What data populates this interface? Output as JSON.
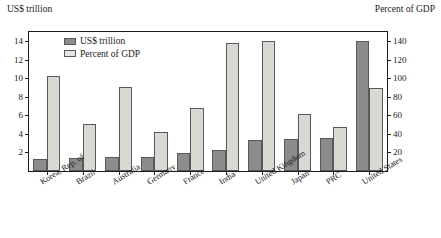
{
  "header": {
    "left_axis_title": "US$ trillion",
    "right_axis_title": "Percent of GDP"
  },
  "legend": {
    "items": [
      {
        "label": "US$ trillion",
        "color": "#8c8c8c",
        "key": "dark"
      },
      {
        "label": "Percent of GDP",
        "color": "#d9d9d4",
        "key": "light"
      }
    ]
  },
  "colors": {
    "dark_bar": "#8c8c8c",
    "light_bar": "#d9d9d4",
    "bar_outline": "#55595c",
    "frame": "#1a1a1a",
    "background": "#ffffff"
  },
  "chart_data": {
    "type": "bar",
    "title": "",
    "xlabel": "",
    "ylabel": "US$ trillion",
    "y2label": "Percent of GDP",
    "ylim": [
      0,
      15
    ],
    "y2lim": [
      0,
      150
    ],
    "yticks": [
      2,
      4,
      6,
      8,
      10,
      12,
      14
    ],
    "y2ticks": [
      20,
      40,
      60,
      80,
      100,
      120,
      140
    ],
    "grid": false,
    "legend_position": "top-left-inside",
    "categories": [
      "Korea, Rep. of",
      "Brazil",
      "Australia",
      "Germany",
      "France",
      "India",
      "United Kingdom",
      "Japan",
      "PRC",
      "United States"
    ],
    "series": [
      {
        "name": "US$ trillion",
        "axis": "left",
        "values": [
          1.3,
          1.4,
          1.5,
          1.5,
          1.9,
          2.3,
          3.3,
          3.5,
          3.6,
          14.0
        ]
      },
      {
        "name": "Percent of GDP",
        "axis": "right",
        "values": [
          102,
          51,
          91,
          42,
          68,
          138,
          140,
          62,
          47,
          90
        ]
      }
    ]
  }
}
